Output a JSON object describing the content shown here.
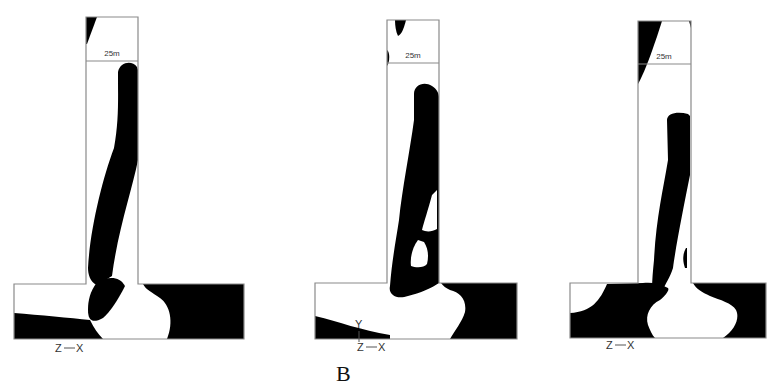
{
  "figure": {
    "caption_label": "B",
    "colors": {
      "solid": "#000000",
      "void": "#ffffff",
      "outline": "#8a8a8a"
    },
    "panels": [
      {
        "id": "panel-1",
        "dimension_label": "25m",
        "axis": {
          "left": "Z",
          "right": "X",
          "up": ""
        },
        "outline_path": "M14,284 L86,284 L86,17 L138,17 L138,284 L244,284 L244,339 L14,339 Z",
        "dim_line": {
          "x1": 86,
          "x2": 138,
          "y": 61,
          "label_x": 112,
          "label_y": 56
        },
        "solid_paths": [
          "M86,17 L97,17 L87,44 L86,44 Z",
          "M118,72 C120,62 132,60 137,67 L138,70 L138,160 C132,190 118,230 112,276 L97,285 C90,282 88,274 88,268 C90,230 102,180 114,148 C119,120 118,100 118,72 Z",
          "M97,282 C108,276 120,276 125,286 C118,300 110,312 103,318 C92,324 88,320 88,310 C88,300 90,292 97,282 Z",
          "M143,284 L244,284 L244,339 L167,339 C174,322 170,305 160,298 C152,292 146,290 143,284 Z",
          "M14,313 C40,315 70,318 90,320 C94,328 98,334 103,339 L14,339 Z"
        ],
        "axis_pos": {
          "x": 55,
          "y": 352
        }
      },
      {
        "id": "panel-2",
        "dimension_label": "25m",
        "axis": {
          "left": "Z",
          "right": "X",
          "up": "Y"
        },
        "outline_path": "M315,283 L387,283 L387,20 L439,20 L439,283 L517,283 L517,339 L315,339 Z",
        "dim_line": {
          "x1": 387,
          "x2": 439,
          "y": 63,
          "label_x": 413,
          "label_y": 58
        },
        "solid_paths": [
          "M395,20 L406,20 C404,28 402,34 398,36 C396,32 395,26 395,20 Z",
          "M387,50 C390,52 390,62 387,66 Z",
          "M414,94 C414,85 424,81 432,86 C437,89 439,94 439,97 L439,283 C432,288 420,293 408,296 C396,300 388,294 390,286 C392,260 396,240 399,220 C402,190 410,150 414,120 Z",
          "M441,283 L517,283 L517,339 L450,339 C455,330 462,322 465,312 C467,300 460,292 450,290 C446,288 443,286 441,283 Z",
          "M315,316 C340,322 360,330 390,335 L390,339 L315,339 Z"
        ],
        "void_paths": [
          "M432,195 C428,210 424,222 422,230 C426,232 432,232 437,229 L437,190 Z",
          "M418,240 C412,248 410,258 411,266 C416,268 424,268 427,264 C429,256 428,248 424,242 Z"
        ],
        "axis_pos": {
          "x": 357,
          "y": 351
        }
      },
      {
        "id": "panel-3",
        "dimension_label": "25m",
        "axis": {
          "left": "Z",
          "right": "X",
          "up": ""
        },
        "outline_path": "M570,283 L638,283 L638,21 L691,21 L691,283 L766,283 L766,338 L570,338 Z",
        "dim_line": {
          "x1": 638,
          "x2": 691,
          "y": 64,
          "label_x": 664,
          "label_y": 59
        },
        "solid_paths": [
          "M638,21 L662,21 C656,40 646,70 638,84 Z",
          "M689,21 L691,21 L691,28 Z",
          "M667,120 C667,113 678,111 688,114 L690,116 L690,175 C684,205 676,245 673,268 C670,278 665,284 663,290 L652,290 C652,280 653,270 654,260 C656,220 663,190 668,160 Z",
          "M686,248 C682,255 683,262 685,268 L687,268 L687,248 Z",
          "M570,313 C592,312 600,300 607,284 L643,283 C650,282 660,283 668,288 C670,290 665,296 660,300 C650,305 645,315 648,325 C650,330 652,335 655,338 L570,338 Z",
          "M693,283 L766,283 L766,338 L723,338 C735,330 740,318 736,310 C732,303 720,300 710,296 C702,292 696,289 693,283 Z"
        ],
        "axis_pos": {
          "x": 606,
          "y": 349
        }
      }
    ]
  }
}
